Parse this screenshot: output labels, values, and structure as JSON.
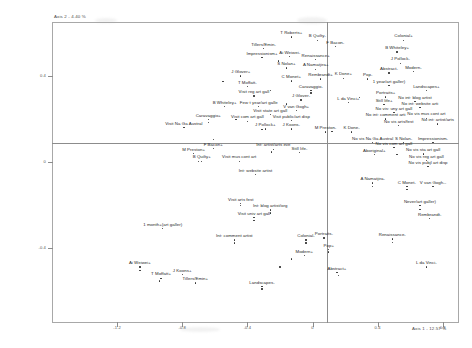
{
  "chart_data": {
    "type": "scatter",
    "title": "",
    "subtitle": "",
    "xlabel": "Axis 1 - 12.57 %",
    "ylabel": "Axis 2 - 4.40 %",
    "xlim": [
      -1.6,
      0.9
    ],
    "ylim": [
      -0.75,
      0.65
    ],
    "grid": false,
    "legend": null,
    "axis_origin_lines": true,
    "xticks": [
      {
        "value": -1.2,
        "label": "-1.2"
      },
      {
        "value": -0.8,
        "label": "-0.8"
      },
      {
        "value": -0.4,
        "label": "-0.4"
      },
      {
        "value": 0.0,
        "label": "0"
      },
      {
        "value": 0.4,
        "label": "0.4"
      },
      {
        "value": 0.8,
        "label": "0.8"
      }
    ],
    "yticks": [
      {
        "value": 0.4,
        "label": "0.4"
      },
      {
        "value": 0.0,
        "label": "0"
      },
      {
        "value": -0.4,
        "label": "-0.4"
      }
    ],
    "points": [
      {
        "label": "T Roberts+",
        "x": -0.13,
        "y": 0.6,
        "lx": -0.13,
        "ly": 0.6
      },
      {
        "label": "B Quilty-",
        "x": 0.03,
        "y": 0.585,
        "lx": 0.03,
        "ly": 0.585
      },
      {
        "label": "F Bacon-",
        "x": 0.14,
        "y": 0.555,
        "lx": 0.14,
        "ly": 0.555
      },
      {
        "label": "Colonial+",
        "x": 0.56,
        "y": 0.585,
        "lx": 0.56,
        "ly": 0.585
      },
      {
        "label": "Tillers/Emin-",
        "x": -0.3,
        "y": 0.545,
        "lx": -0.3,
        "ly": 0.545
      },
      {
        "label": "Ai Weiwei-",
        "x": -0.14,
        "y": 0.508,
        "lx": -0.14,
        "ly": 0.508
      },
      {
        "label": "B Whiteley+",
        "x": 0.52,
        "y": 0.53,
        "lx": 0.52,
        "ly": 0.53
      },
      {
        "label": "Impressionism+",
        "x": -0.31,
        "y": 0.505,
        "lx": -0.31,
        "ly": 0.505
      },
      {
        "label": "Renaissance+",
        "x": 0.02,
        "y": 0.495,
        "lx": 0.02,
        "ly": 0.495
      },
      {
        "label": "J Pollock-",
        "x": 0.54,
        "y": 0.478,
        "lx": 0.54,
        "ly": 0.478
      },
      {
        "label": "S Nolan+",
        "x": -0.16,
        "y": 0.455,
        "lx": -0.16,
        "ly": 0.455
      },
      {
        "label": "A Namatjira+",
        "x": 0.02,
        "y": 0.45,
        "lx": 0.02,
        "ly": 0.45
      },
      {
        "label": "Modern-",
        "x": 0.62,
        "y": 0.44,
        "lx": 0.62,
        "ly": 0.44
      },
      {
        "label": "Abstract-",
        "x": 0.47,
        "y": 0.432,
        "lx": 0.47,
        "ly": 0.432
      },
      {
        "label": "J Glover+",
        "x": -0.44,
        "y": 0.418,
        "lx": -0.44,
        "ly": 0.418
      },
      {
        "label": "Pop-",
        "x": 0.34,
        "y": 0.405,
        "lx": 0.34,
        "ly": 0.405
      },
      {
        "label": "Rembrandt+",
        "x": 0.05,
        "y": 0.405,
        "lx": 0.05,
        "ly": 0.405
      },
      {
        "label": "K Done+",
        "x": 0.19,
        "y": 0.408,
        "lx": 0.19,
        "ly": 0.408
      },
      {
        "label": "C Monet+",
        "x": -0.13,
        "y": 0.395,
        "lx": -0.13,
        "ly": 0.395
      },
      {
        "label": "1 year/art galler)",
        "x": 0.47,
        "y": 0.375,
        "lx": 0.47,
        "ly": 0.375
      },
      {
        "label": "T Moffatt-",
        "x": -0.4,
        "y": 0.368,
        "lx": -0.4,
        "ly": 0.368
      },
      {
        "label": "Landscapes+",
        "x": 0.7,
        "y": 0.352,
        "lx": 0.7,
        "ly": 0.352
      },
      {
        "label": "Caravaggio-",
        "x": -0.01,
        "y": 0.352,
        "lx": -0.01,
        "ly": 0.352
      },
      {
        "label": "Portraits+",
        "x": 0.45,
        "y": 0.32,
        "lx": 0.45,
        "ly": 0.32
      },
      {
        "label": "Visit reg art gall",
        "x": -0.36,
        "y": 0.325,
        "lx": -0.36,
        "ly": 0.325
      },
      {
        "label": "J Glover-",
        "x": -0.07,
        "y": 0.307,
        "lx": -0.07,
        "ly": 0.307
      },
      {
        "label": "L da Vinci+",
        "x": 0.22,
        "y": 0.295,
        "lx": 0.22,
        "ly": 0.295
      },
      {
        "label": "Still life+",
        "x": 0.44,
        "y": 0.285,
        "lx": 0.44,
        "ly": 0.285
      },
      {
        "label": "No int: blog artist",
        "x": 0.63,
        "y": 0.3,
        "lx": 0.63,
        "ly": 0.3
      },
      {
        "label": "No int: website arti",
        "x": 0.66,
        "y": 0.272,
        "lx": 0.66,
        "ly": 0.272
      },
      {
        "label": "B Whiteley+",
        "x": -0.54,
        "y": 0.275,
        "lx": -0.54,
        "ly": 0.275
      },
      {
        "label": "Few t year/art galle",
        "x": -0.33,
        "y": 0.275,
        "lx": -0.33,
        "ly": 0.275
      },
      {
        "label": "V van Gogh+",
        "x": -0.1,
        "y": 0.258,
        "lx": -0.1,
        "ly": 0.258
      },
      {
        "label": "No vis: uny art gall",
        "x": 0.5,
        "y": 0.248,
        "lx": 0.5,
        "ly": 0.248
      },
      {
        "label": "Visit state art gall",
        "x": -0.26,
        "y": 0.238,
        "lx": -0.26,
        "ly": 0.238
      },
      {
        "label": "No int: comment arti",
        "x": 0.45,
        "y": 0.218,
        "lx": 0.45,
        "ly": 0.218
      },
      {
        "label": "No vis mus cont art",
        "x": 0.7,
        "y": 0.222,
        "lx": 0.7,
        "ly": 0.222
      },
      {
        "label": "Caravaggio+",
        "x": -0.64,
        "y": 0.215,
        "lx": -0.64,
        "ly": 0.215
      },
      {
        "label": "Visit com art gall",
        "x": -0.4,
        "y": 0.208,
        "lx": -0.4,
        "ly": 0.208
      },
      {
        "label": "Visit public/art disp",
        "x": -0.13,
        "y": 0.212,
        "lx": -0.13,
        "ly": 0.212
      },
      {
        "label": "No int: artist/arts",
        "x": 0.77,
        "y": 0.195,
        "lx": 0.77,
        "ly": 0.195
      },
      {
        "label": "No vis arts/fest",
        "x": 0.53,
        "y": 0.188,
        "lx": 0.53,
        "ly": 0.188
      },
      {
        "label": "Visit Na Ga Austral",
        "x": -0.79,
        "y": 0.18,
        "lx": -0.79,
        "ly": 0.18
      },
      {
        "label": "J Pollock+",
        "x": -0.29,
        "y": 0.172,
        "lx": -0.29,
        "ly": 0.172
      },
      {
        "label": "J Koons-",
        "x": -0.13,
        "y": 0.172,
        "lx": -0.13,
        "ly": 0.172
      },
      {
        "label": "M Preston-",
        "x": 0.08,
        "y": 0.158,
        "lx": 0.08,
        "ly": 0.158
      },
      {
        "label": "K Done-",
        "x": 0.24,
        "y": 0.158,
        "lx": 0.24,
        "ly": 0.158
      },
      {
        "label": "No vis Na Ga Austral",
        "x": 0.37,
        "y": 0.11,
        "lx": 0.37,
        "ly": 0.11
      },
      {
        "label": "S Nolan-",
        "x": 0.56,
        "y": 0.11,
        "lx": 0.56,
        "ly": 0.11
      },
      {
        "label": "Impressionism-",
        "x": 0.74,
        "y": 0.11,
        "lx": 0.74,
        "ly": 0.11
      },
      {
        "label": "No vis com art gall",
        "x": 0.5,
        "y": 0.085,
        "lx": 0.5,
        "ly": 0.085
      },
      {
        "label": "F Bacon+",
        "x": -0.61,
        "y": 0.08,
        "lx": -0.61,
        "ly": 0.08
      },
      {
        "label": "Int: artist/arts eve",
        "x": -0.24,
        "y": 0.078,
        "lx": -0.24,
        "ly": 0.078
      },
      {
        "label": "M Preston+",
        "x": -0.73,
        "y": 0.058,
        "lx": -0.73,
        "ly": 0.058
      },
      {
        "label": "Still life-",
        "x": -0.08,
        "y": 0.062,
        "lx": -0.08,
        "ly": 0.062
      },
      {
        "label": "Aboriginal+",
        "x": 0.38,
        "y": 0.052,
        "lx": 0.38,
        "ly": 0.052
      },
      {
        "label": "No vis sta art gall",
        "x": 0.68,
        "y": 0.055,
        "lx": 0.68,
        "ly": 0.055
      },
      {
        "label": "B Quilty+",
        "x": -0.68,
        "y": 0.022,
        "lx": -0.68,
        "ly": 0.022
      },
      {
        "label": "Visit mus cont art",
        "x": -0.45,
        "y": 0.022,
        "lx": -0.45,
        "ly": 0.022
      },
      {
        "label": "No vis reg art gall",
        "x": 0.7,
        "y": 0.025,
        "lx": 0.7,
        "ly": 0.025
      },
      {
        "label": "No vis pubjl art disp",
        "x": 0.71,
        "y": -0.002,
        "lx": 0.71,
        "ly": -0.002
      },
      {
        "label": "Int: website artist",
        "x": -0.35,
        "y": -0.04,
        "lx": -0.35,
        "ly": -0.04
      },
      {
        "label": "A Namatjira-",
        "x": 0.37,
        "y": -0.08,
        "lx": 0.37,
        "ly": -0.08
      },
      {
        "label": "C Monet-",
        "x": 0.58,
        "y": -0.095,
        "lx": 0.58,
        "ly": -0.095
      },
      {
        "label": "V van Gogh--",
        "x": 0.74,
        "y": -0.095,
        "lx": 0.74,
        "ly": -0.095
      },
      {
        "label": "Visit arts fest",
        "x": -0.44,
        "y": -0.175,
        "lx": -0.44,
        "ly": -0.175
      },
      {
        "label": "Int: blog artist/org",
        "x": -0.26,
        "y": -0.205,
        "lx": -0.26,
        "ly": -0.205
      },
      {
        "label": "Never/art galler)",
        "x": 0.66,
        "y": -0.185,
        "lx": 0.66,
        "ly": -0.185
      },
      {
        "label": "Visit univ art gall",
        "x": -0.36,
        "y": -0.24,
        "lx": -0.36,
        "ly": -0.24
      },
      {
        "label": "Rembrandt-",
        "x": 0.72,
        "y": -0.245,
        "lx": 0.72,
        "ly": -0.245
      },
      {
        "label": "1 month+(art galler)",
        "x": -0.92,
        "y": -0.29,
        "lx": -0.92,
        "ly": -0.29
      },
      {
        "label": "Int: comment artist",
        "x": -0.48,
        "y": -0.345,
        "lx": -0.48,
        "ly": -0.345
      },
      {
        "label": "Renaissance-",
        "x": 0.49,
        "y": -0.34,
        "lx": 0.49,
        "ly": -0.34
      },
      {
        "label": "Colonial-",
        "x": -0.04,
        "y": -0.345,
        "lx": -0.04,
        "ly": -0.345
      },
      {
        "label": "Portraits-",
        "x": 0.07,
        "y": -0.335,
        "lx": 0.07,
        "ly": -0.335
      },
      {
        "label": "Pop+",
        "x": 0.1,
        "y": -0.39,
        "lx": 0.1,
        "ly": -0.39
      },
      {
        "label": "Modern+",
        "x": -0.05,
        "y": -0.418,
        "lx": -0.05,
        "ly": -0.418
      },
      {
        "label": "Ai Weiwei+",
        "x": -1.06,
        "y": -0.47,
        "lx": -1.06,
        "ly": -0.47
      },
      {
        "label": "L da Vinci-",
        "x": 0.7,
        "y": -0.47,
        "lx": 0.7,
        "ly": -0.47
      },
      {
        "label": "J Koons+",
        "x": -0.8,
        "y": -0.505,
        "lx": -0.8,
        "ly": -0.505
      },
      {
        "label": "T Moffatt+",
        "x": -0.93,
        "y": -0.522,
        "lx": -0.93,
        "ly": -0.522
      },
      {
        "label": "Abstract+",
        "x": 0.15,
        "y": -0.495,
        "lx": 0.15,
        "ly": -0.495
      },
      {
        "label": "Tillers/Emin+",
        "x": -0.72,
        "y": -0.545,
        "lx": -0.72,
        "ly": -0.545
      },
      {
        "label": "Landscapes-",
        "x": -0.31,
        "y": -0.562,
        "lx": -0.31,
        "ly": -0.562
      }
    ],
    "extra_markers": [
      {
        "x": -0.21,
        "y": 0.468
      },
      {
        "x": -0.55,
        "y": 0.372
      },
      {
        "x": -0.26,
        "y": 0.332
      },
      {
        "x": 0.29,
        "y": 0.3
      },
      {
        "x": -0.16,
        "y": 0.268
      },
      {
        "x": -0.47,
        "y": 0.196
      },
      {
        "x": -0.31,
        "y": 0.15
      },
      {
        "x": 0.12,
        "y": 0.14
      },
      {
        "x": -0.61,
        "y": 0.105
      },
      {
        "x": -0.25,
        "y": 0.045
      },
      {
        "x": -0.7,
        "y": 0.0
      },
      {
        "x": 0.52,
        "y": 0.035
      },
      {
        "x": -0.44,
        "y": -0.205
      },
      {
        "x": -0.26,
        "y": -0.238
      },
      {
        "x": -0.36,
        "y": -0.272
      },
      {
        "x": -0.48,
        "y": -0.378
      },
      {
        "x": -0.04,
        "y": -0.378
      },
      {
        "x": 0.1,
        "y": -0.42
      },
      {
        "x": -0.13,
        "y": -0.452
      },
      {
        "x": -0.2,
        "y": -0.49
      },
      {
        "x": 0.16,
        "y": -0.528
      },
      {
        "x": -0.94,
        "y": -0.555
      },
      {
        "x": -0.31,
        "y": -0.592
      },
      {
        "x": 0.58,
        "y": -0.128
      },
      {
        "x": 0.66,
        "y": -0.222
      },
      {
        "x": 0.49,
        "y": -0.375
      },
      {
        "x": 0.37,
        "y": -0.115
      },
      {
        "x": -1.06,
        "y": -0.505
      },
      {
        "x": -0.64,
        "y": 0.182
      },
      {
        "x": -0.01,
        "y": 0.32
      }
    ]
  }
}
